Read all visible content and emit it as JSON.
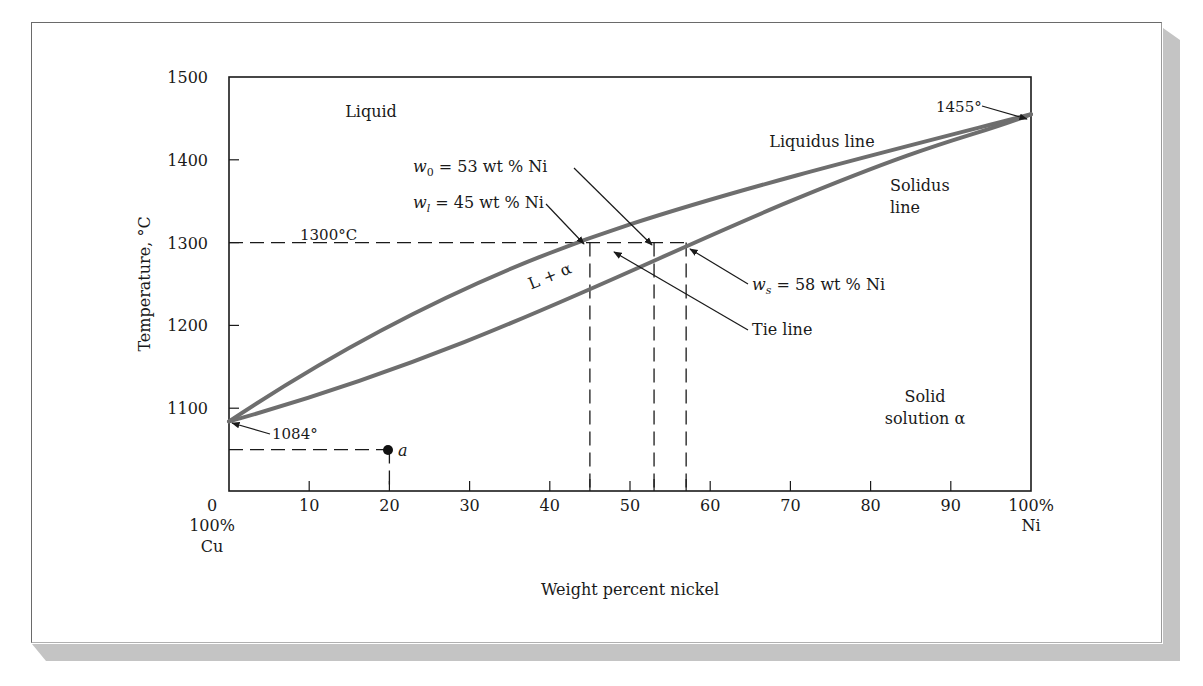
{
  "chart_data": {
    "type": "line",
    "title": "",
    "xlabel": "Weight percent nickel",
    "ylabel": "Temperature, °C",
    "xlim": [
      0,
      100
    ],
    "ylim": [
      1000,
      1500
    ],
    "grid": false,
    "x_ticks": [
      {
        "value": 0,
        "label": "0"
      },
      {
        "value": 10,
        "label": "10"
      },
      {
        "value": 20,
        "label": "20"
      },
      {
        "value": 30,
        "label": "30"
      },
      {
        "value": 40,
        "label": "40"
      },
      {
        "value": 50,
        "label": "50"
      },
      {
        "value": 60,
        "label": "60"
      },
      {
        "value": 70,
        "label": "70"
      },
      {
        "value": 80,
        "label": "80"
      },
      {
        "value": 90,
        "label": "90"
      },
      {
        "value": 100,
        "label": "100%"
      }
    ],
    "x_end_labels": {
      "left_line1": "100%",
      "left_line2": "Cu",
      "right_line2": "Ni"
    },
    "y_ticks": [
      {
        "value": 1100,
        "label": "1100"
      },
      {
        "value": 1200,
        "label": "1200"
      },
      {
        "value": 1300,
        "label": "1300"
      },
      {
        "value": 1400,
        "label": "1400"
      },
      {
        "value": 1500,
        "label": "1500"
      }
    ],
    "series": [
      {
        "name": "Liquidus line",
        "color": "#6e6e6e",
        "x": [
          0,
          5,
          10,
          15,
          20,
          25,
          30,
          35,
          40,
          45,
          50,
          55,
          60,
          65,
          70,
          75,
          80,
          85,
          90,
          95,
          100
        ],
        "y": [
          1084,
          1121,
          1154,
          1183,
          1209,
          1233,
          1255,
          1275,
          1293,
          1300,
          1318,
          1334,
          1348,
          1361,
          1374,
          1387,
          1399,
          1411,
          1422,
          1436,
          1455
        ]
      },
      {
        "name": "Solidus line",
        "color": "#6e6e6e",
        "x": [
          0,
          10,
          20,
          30,
          40,
          50,
          57,
          60,
          70,
          80,
          90,
          100
        ],
        "y": [
          1084,
          1112,
          1140,
          1169,
          1198,
          1236,
          1300,
          1276,
          1306,
          1338,
          1376,
          1455
        ]
      }
    ],
    "reference_lines": {
      "isotherm_1300": {
        "temperature": 1300,
        "label": "1300°C",
        "x_from": 0,
        "x_to": 57
      },
      "verticals": [
        45,
        53,
        57
      ],
      "point_a": {
        "x": 20,
        "y": 1050,
        "label": "a"
      }
    },
    "annotations": [
      {
        "text": "Liquid",
        "x": 17,
        "y": 1455
      },
      {
        "text": "Liquidus line",
        "x": 73,
        "y": 1415
      },
      {
        "text": "Solidus",
        "x": 86,
        "y": 1395
      },
      {
        "text": "line",
        "x": 86,
        "y": 1370
      },
      {
        "text": "L + α",
        "x": 40,
        "y": 1250,
        "rotation": -22
      },
      {
        "text": "Solid",
        "x": 90,
        "y": 1110
      },
      {
        "text": "solution α",
        "x": 90,
        "y": 1085
      },
      {
        "text": "1455°",
        "x": 96,
        "y": 1465
      },
      {
        "text": "1084°",
        "x": 5,
        "y": 1067
      },
      {
        "text": "w0 = 53 wt % Ni",
        "x": 53
      },
      {
        "text": "wl = 45 wt % Ni",
        "x": 45
      },
      {
        "text": "ws = 58 wt % Ni",
        "x": 58
      },
      {
        "text": "Tie line"
      }
    ]
  },
  "labels": {
    "liquid": "Liquid",
    "liquidus": "Liquidus line",
    "solidus_1": "Solidus",
    "solidus_2": "line",
    "two_phase": "L + α",
    "solid_1": "Solid",
    "solid_2": "solution α",
    "temp_ni": "1455°",
    "temp_cu": "1084°",
    "isotherm": "1300°C",
    "w0_var": "w",
    "w0_sub": "0",
    "w0_rest": " = 53 wt % Ni",
    "wl_var": "w",
    "wl_sub": "l",
    "wl_rest": " = 45 wt % Ni",
    "ws_var": "w",
    "ws_sub": "s",
    "ws_rest": " = 58 wt % Ni",
    "tie_line": "Tie line",
    "point_a": "a"
  }
}
